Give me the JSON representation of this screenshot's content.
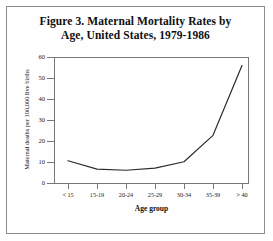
{
  "figure": {
    "title_line1": "Figure 3. Maternal Mortality Rates by",
    "title_line2": "Age, United States, 1979-1986"
  },
  "chart_data": {
    "type": "line",
    "title": "Figure 3. Maternal Mortality Rates by Age, United States, 1979-1986",
    "xlabel": "Age group",
    "ylabel": "Maternal deaths per 100,000 live births",
    "categories": [
      "< 15",
      "15-19",
      "20-24",
      "25-29",
      "30-34",
      "35-39",
      "> 40"
    ],
    "values": [
      11,
      7,
      6.5,
      7.5,
      10.5,
      23,
      56
    ],
    "ylim": [
      0,
      60
    ],
    "yticks": [
      0,
      10,
      20,
      30,
      40,
      50,
      60
    ],
    "ytick_labels": [
      "0",
      "10",
      "20",
      "30",
      "40",
      "50",
      "60"
    ],
    "grid": false,
    "legend": false,
    "line_color": "#2b2b2b",
    "series": [
      {
        "name": "Maternal mortality rate",
        "values": [
          11,
          7,
          6.5,
          7.5,
          10.5,
          23,
          56
        ]
      }
    ]
  }
}
